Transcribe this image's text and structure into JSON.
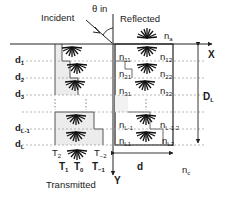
{
  "labels": {
    "incident": "Incident",
    "theta_in": "θ in",
    "reflected": "Reflected",
    "transmitted": "Transmitted",
    "x_axis": "X",
    "y_axis": "Y",
    "period": "d",
    "total_depth": "D",
    "total_depth_sub": "L",
    "n_a": "n",
    "n_a_sub": "a",
    "n_c": "n",
    "n_c_sub": "c"
  },
  "layers": [
    {
      "label": "d",
      "sub": "1",
      "n_left": "n",
      "n_left_sub": "11",
      "n_right": "n",
      "n_right_sub": "12"
    },
    {
      "label": "d",
      "sub": "2",
      "n_left": "n",
      "n_left_sub": "21",
      "n_right": "n",
      "n_right_sub": "22"
    },
    {
      "label": "d",
      "sub": "3",
      "n_left": "n",
      "n_left_sub": "31",
      "n_right": "n",
      "n_right_sub": "32"
    },
    {
      "label": "d",
      "sub": "L-1",
      "n_left": "n",
      "n_left_sub": "L-1",
      "n_right": "n",
      "n_right_sub": "L-1 2"
    },
    {
      "label": "d",
      "sub": "L",
      "n_left": "n",
      "n_left_sub": "L1",
      "n_right": "n",
      "n_right_sub": "L2"
    }
  ],
  "orders": {
    "t2": {
      "main": "T",
      "sub": "2"
    },
    "tm2": {
      "main": "T",
      "sub": "−2"
    },
    "t1": {
      "main": "T",
      "sub": "1"
    },
    "t0": {
      "main": "T",
      "sub": "0"
    },
    "tm1": {
      "main": "T",
      "sub": "−1"
    }
  },
  "colors": {
    "line": "#222222",
    "dashed": "#888888",
    "shade": "#ececec",
    "background": "#ffffff"
  }
}
